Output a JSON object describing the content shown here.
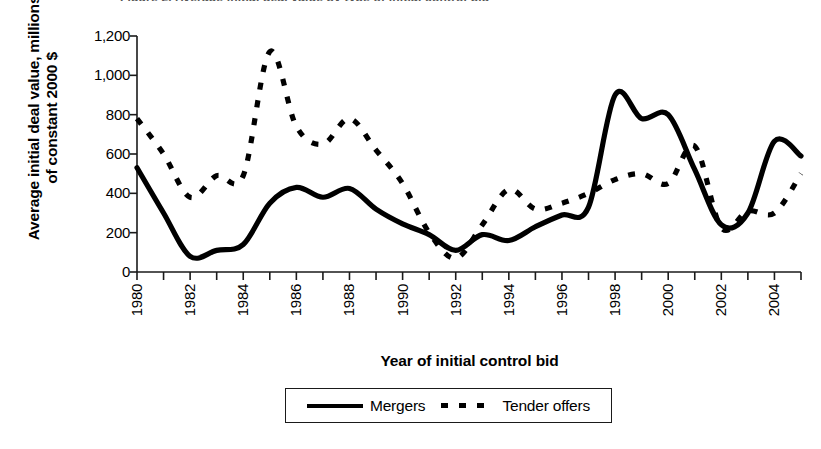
{
  "figure": {
    "cut_title_fragment": "Figure 2. Average initial deal value by type of initial control bid",
    "y_axis_title": "Average initial deal value, millions of constant 2000 $",
    "x_axis_title": "Year of initial control bid"
  },
  "legend": {
    "entries": [
      {
        "label": "Mergers",
        "style": "solid",
        "swatch": "solid-line-swatch"
      },
      {
        "label": "Tender offers",
        "style": "dashed",
        "swatch": "dashed-line-swatch"
      }
    ]
  },
  "axes": {
    "y_ticks": [
      "1,200",
      "1,000",
      "800",
      "600",
      "400",
      "200",
      "0"
    ],
    "y_tick_values": [
      1200,
      1000,
      800,
      600,
      400,
      200,
      0
    ],
    "x_ticks_labeled": [
      "1980",
      "1982",
      "1984",
      "1986",
      "1988",
      "1990",
      "1992",
      "1994",
      "1996",
      "1998",
      "2000",
      "2002",
      "2004"
    ],
    "x_tick_all_years": [
      1980,
      1981,
      1982,
      1983,
      1984,
      1985,
      1986,
      1987,
      1988,
      1989,
      1990,
      1991,
      1992,
      1993,
      1994,
      1995,
      1996,
      1997,
      1998,
      1999,
      2000,
      2001,
      2002,
      2003,
      2004,
      2005
    ]
  },
  "chart_data": {
    "type": "line",
    "title": "Average initial deal value by type of initial control bid",
    "xlabel": "Year of initial control bid",
    "ylabel": "Average initial deal value, millions of constant 2000 $",
    "xlim": [
      1980,
      2005
    ],
    "ylim": [
      0,
      1200
    ],
    "grid": false,
    "legend_position": "bottom-center",
    "x": [
      1980,
      1981,
      1982,
      1983,
      1984,
      1985,
      1986,
      1987,
      1988,
      1989,
      1990,
      1991,
      1992,
      1993,
      1994,
      1995,
      1996,
      1997,
      1998,
      1999,
      2000,
      2001,
      2002,
      2003,
      2004,
      2005
    ],
    "series": [
      {
        "name": "Mergers",
        "style": "solid",
        "color": "#000000",
        "values": [
          530,
          300,
          80,
          110,
          140,
          350,
          430,
          380,
          425,
          320,
          245,
          190,
          110,
          190,
          160,
          230,
          290,
          330,
          900,
          780,
          800,
          520,
          240,
          300,
          665,
          590
        ]
      },
      {
        "name": "Tender offers",
        "style": "dashed",
        "color": "#000000",
        "values": [
          780,
          600,
          380,
          490,
          490,
          1120,
          740,
          650,
          780,
          620,
          450,
          200,
          70,
          240,
          420,
          320,
          350,
          400,
          470,
          500,
          450,
          640,
          225,
          310,
          300,
          500
        ]
      }
    ]
  }
}
